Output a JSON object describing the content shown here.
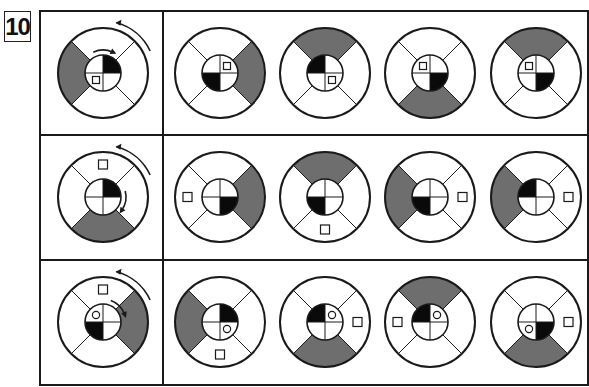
{
  "problem_number": "10",
  "colors": {
    "gray": "#6e6e6e",
    "black": "#0a0a0a",
    "line": "#1a1a1a",
    "background": "#ffffff"
  },
  "grid": {
    "left": 40,
    "top": 11,
    "right": 588,
    "bottom": 385,
    "column_divider_x": 163,
    "row_dividers_y": [
      135,
      260
    ]
  },
  "rows": [
    {
      "reference": {
        "outer_gray": "left",
        "inner_black": "TR",
        "square": {
          "ring": "inner",
          "pos": "BL"
        },
        "circle": null,
        "arrows": {
          "outer": "ccw",
          "inner": "cw-top"
        }
      },
      "options": [
        {
          "outer_gray": "right",
          "inner_black": "BL",
          "square": {
            "ring": "inner",
            "pos": "TR"
          },
          "circle": null
        },
        {
          "outer_gray": "top",
          "inner_black": "TL",
          "square": {
            "ring": "inner",
            "pos": "BR"
          },
          "circle": null
        },
        {
          "outer_gray": "bottom",
          "inner_black": "BR",
          "square": {
            "ring": "inner",
            "pos": "TL"
          },
          "circle": null
        },
        {
          "outer_gray": "top",
          "inner_black": "BR",
          "square": {
            "ring": "inner",
            "pos": "TL"
          },
          "circle": null
        }
      ]
    },
    {
      "reference": {
        "outer_gray": "bottom",
        "inner_black": "TR",
        "square": {
          "ring": "outer",
          "pos": "top"
        },
        "circle": null,
        "arrows": {
          "outer": "ccw",
          "inner": "cw-right"
        }
      },
      "options": [
        {
          "outer_gray": "right",
          "inner_black": "BR",
          "square": {
            "ring": "outer",
            "pos": "left"
          },
          "circle": null
        },
        {
          "outer_gray": "top",
          "inner_black": "BL",
          "square": {
            "ring": "outer",
            "pos": "bottom"
          },
          "circle": null
        },
        {
          "outer_gray": "left",
          "inner_black": "BL",
          "square": {
            "ring": "outer",
            "pos": "right"
          },
          "circle": null
        },
        {
          "outer_gray": "left",
          "inner_black": "TL",
          "square": {
            "ring": "outer",
            "pos": "right"
          },
          "circle": null
        }
      ]
    },
    {
      "reference": {
        "outer_gray": "right",
        "inner_black": "BL",
        "square": {
          "ring": "outer",
          "pos": "top"
        },
        "circle": {
          "ring": "inner",
          "pos": "TL"
        },
        "arrows": {
          "outer": "ccw",
          "inner": "cw-topright"
        }
      },
      "options": [
        {
          "outer_gray": "left",
          "inner_black": "TR",
          "square": {
            "ring": "outer",
            "pos": "bottom"
          },
          "circle": {
            "ring": "inner",
            "pos": "BR"
          }
        },
        {
          "outer_gray": "bottom",
          "inner_black": "TL",
          "square": {
            "ring": "outer",
            "pos": "right"
          },
          "circle": {
            "ring": "inner",
            "pos": "TR"
          }
        },
        {
          "outer_gray": "top",
          "inner_black": "TL",
          "square": {
            "ring": "outer",
            "pos": "left"
          },
          "circle": {
            "ring": "inner",
            "pos": "TR"
          }
        },
        {
          "outer_gray": "bottom",
          "inner_black": "BR",
          "square": {
            "ring": "outer",
            "pos": "right"
          },
          "circle": {
            "ring": "inner",
            "pos": "BL"
          }
        }
      ]
    }
  ]
}
